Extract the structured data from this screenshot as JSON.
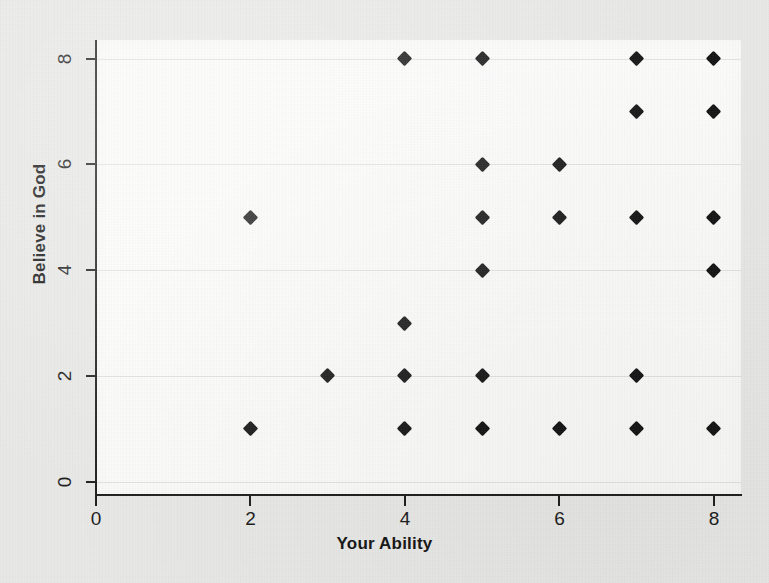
{
  "chart_data": {
    "type": "scatter",
    "title": "",
    "xlabel": "Your Ability",
    "ylabel": "Believe in God",
    "xlim": [
      0,
      8.35
    ],
    "ylim": [
      -0.25,
      8.35
    ],
    "xticks": [
      0,
      2,
      4,
      6,
      8
    ],
    "yticks": [
      0,
      2,
      4,
      6,
      8
    ],
    "xtick_labels": [
      "0",
      "2",
      "4",
      "6",
      "8"
    ],
    "ytick_labels": [
      "0",
      "2",
      "4",
      "6",
      "8"
    ],
    "grid": true,
    "grid_axis": "y",
    "legend": false,
    "marker": "diamond",
    "marker_color": "#141414",
    "background_color": "#e8e8e6",
    "plot_background_color": "#fbfbfa",
    "axis_color": "#1d1d1d",
    "points": [
      {
        "x": 4,
        "y": 8
      },
      {
        "x": 5,
        "y": 8
      },
      {
        "x": 7,
        "y": 8
      },
      {
        "x": 8,
        "y": 8
      },
      {
        "x": 7,
        "y": 7
      },
      {
        "x": 8,
        "y": 7
      },
      {
        "x": 5,
        "y": 6
      },
      {
        "x": 6,
        "y": 6
      },
      {
        "x": 2,
        "y": 5
      },
      {
        "x": 5,
        "y": 5
      },
      {
        "x": 6,
        "y": 5
      },
      {
        "x": 7,
        "y": 5
      },
      {
        "x": 8,
        "y": 5
      },
      {
        "x": 5,
        "y": 4
      },
      {
        "x": 8,
        "y": 4
      },
      {
        "x": 4,
        "y": 3
      },
      {
        "x": 3,
        "y": 2
      },
      {
        "x": 4,
        "y": 2
      },
      {
        "x": 5,
        "y": 2
      },
      {
        "x": 7,
        "y": 2
      },
      {
        "x": 2,
        "y": 1
      },
      {
        "x": 4,
        "y": 1
      },
      {
        "x": 5,
        "y": 1
      },
      {
        "x": 6,
        "y": 1
      },
      {
        "x": 7,
        "y": 1
      },
      {
        "x": 8,
        "y": 1
      }
    ]
  }
}
